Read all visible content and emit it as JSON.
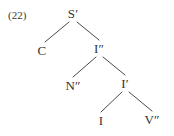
{
  "figure": {
    "example_number": "(22)",
    "background_color": "#ffffff",
    "text_color": "#333333",
    "line_color": "#4a4a4a"
  },
  "tree": {
    "nodes": [
      {
        "id": "root",
        "label": "S′",
        "x": 73,
        "y": 13
      },
      {
        "id": "c",
        "label": "C",
        "x": 42,
        "y": 50
      },
      {
        "id": "ibar2",
        "label": "I″",
        "x": 99,
        "y": 48
      },
      {
        "id": "nbar2",
        "label": "N″",
        "x": 73,
        "y": 85
      },
      {
        "id": "ibar1",
        "label": "I′",
        "x": 125,
        "y": 83
      },
      {
        "id": "i",
        "label": "I",
        "x": 101,
        "y": 120
      },
      {
        "id": "vbar2",
        "label": "V″",
        "x": 152,
        "y": 119
      }
    ],
    "edges": [
      {
        "id": "root-c",
        "from": "root",
        "to": "c",
        "x1": 69,
        "y1": 22,
        "x2": 45,
        "y2": 42
      },
      {
        "id": "root-ibar2",
        "from": "root",
        "to": "ibar2",
        "x1": 77,
        "y1": 22,
        "x2": 99,
        "y2": 40
      },
      {
        "id": "ibar2-nbar2",
        "from": "ibar2",
        "to": "nbar2",
        "x1": 96,
        "y1": 57,
        "x2": 73,
        "y2": 77
      },
      {
        "id": "ibar2-ibar1",
        "from": "ibar2",
        "to": "ibar1",
        "x1": 103,
        "y1": 57,
        "x2": 125,
        "y2": 75
      },
      {
        "id": "ibar1-i",
        "from": "ibar1",
        "to": "i",
        "x1": 122,
        "y1": 92,
        "x2": 101,
        "y2": 112
      },
      {
        "id": "ibar1-vbar2",
        "from": "ibar1",
        "to": "vbar2",
        "x1": 129,
        "y1": 92,
        "x2": 152,
        "y2": 111
      }
    ]
  }
}
